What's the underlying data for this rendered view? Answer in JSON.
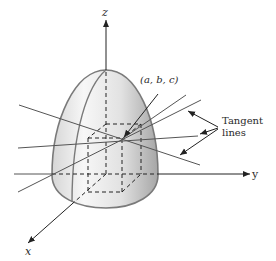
{
  "figure": {
    "axes": {
      "z_label": "z",
      "y_label": "y",
      "x_label": "x"
    },
    "point_label": "(a, b, c)",
    "callout": {
      "line1": "Tangent",
      "line2": "lines"
    },
    "colors": {
      "surface_edge": "#7a7a7a",
      "surface_light": "#f4f4f4",
      "surface_dark": "#a9a9a9",
      "lines": "#555555",
      "ink": "#222222"
    }
  }
}
